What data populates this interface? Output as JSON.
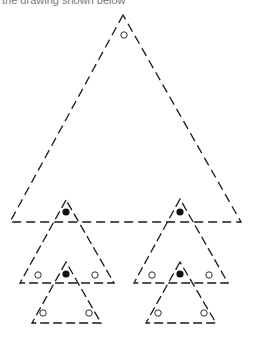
{
  "caption": "the drawing shown below",
  "colors": {
    "stroke": "#1a1a1a",
    "dot_filled": "#111111",
    "dot_hollow_fill": "#ffffff"
  },
  "triangles": [
    {
      "id": "large",
      "points": [
        [
          123,
          15
        ],
        [
          10,
          222
        ],
        [
          241,
          222
        ]
      ],
      "dash": "9,5",
      "filled_dots": [],
      "hollow_dots": [
        [
          124,
          35
        ]
      ]
    },
    {
      "id": "medium-left",
      "points": [
        [
          66,
          200
        ],
        [
          20,
          283
        ],
        [
          114,
          283
        ]
      ],
      "dash": "9,4",
      "filled_dots": [
        [
          66,
          212
        ]
      ],
      "hollow_dots": [
        [
          38,
          275
        ],
        [
          95,
          275
        ]
      ]
    },
    {
      "id": "medium-right",
      "points": [
        [
          180,
          199
        ],
        [
          134,
          283
        ],
        [
          228,
          283
        ]
      ],
      "dash": "9,4",
      "filled_dots": [
        [
          180,
          212
        ]
      ],
      "hollow_dots": [
        [
          152,
          275
        ],
        [
          209,
          275
        ]
      ]
    },
    {
      "id": "small-left",
      "points": [
        [
          66,
          262
        ],
        [
          32,
          323
        ],
        [
          101,
          323
        ]
      ],
      "dash": "9,4",
      "filled_dots": [
        [
          66,
          274
        ]
      ],
      "hollow_dots": [
        [
          43,
          313
        ],
        [
          89,
          313
        ]
      ]
    },
    {
      "id": "small-right",
      "points": [
        [
          180,
          262
        ],
        [
          146,
          323
        ],
        [
          216,
          323
        ]
      ],
      "dash": "9,4",
      "filled_dots": [
        [
          180,
          274
        ]
      ],
      "hollow_dots": [
        [
          158,
          313
        ],
        [
          204,
          313
        ]
      ]
    }
  ]
}
